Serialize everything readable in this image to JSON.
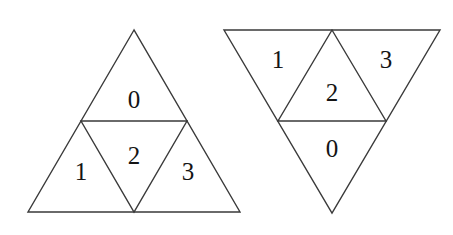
{
  "figure": {
    "background_color": "#ffffff",
    "stroke_color": "#3a3a3a",
    "label_color": "#141414",
    "shapes": [
      {
        "name": "upright-triangle",
        "orientation": "upright",
        "outline": "134,30 28,212 240,212",
        "inner": "81,121 187,121 134,212",
        "labels": [
          {
            "text": "0",
            "x": 134,
            "y": 99,
            "region": "top"
          },
          {
            "text": "1",
            "x": 81,
            "y": 171,
            "region": "lower-left"
          },
          {
            "text": "2",
            "x": 134,
            "y": 155,
            "region": "center"
          },
          {
            "text": "3",
            "x": 188,
            "y": 171,
            "region": "lower-right"
          }
        ]
      },
      {
        "name": "inverted-triangle",
        "orientation": "inverted",
        "outline": "224,30 440,30 332,213",
        "inner": "332,30 278,121 386,121",
        "labels": [
          {
            "text": "1",
            "x": 278,
            "y": 59,
            "region": "upper-left"
          },
          {
            "text": "3",
            "x": 386,
            "y": 59,
            "region": "upper-right"
          },
          {
            "text": "2",
            "x": 332,
            "y": 92,
            "region": "center"
          },
          {
            "text": "0",
            "x": 332,
            "y": 148,
            "region": "bottom"
          }
        ]
      }
    ]
  }
}
